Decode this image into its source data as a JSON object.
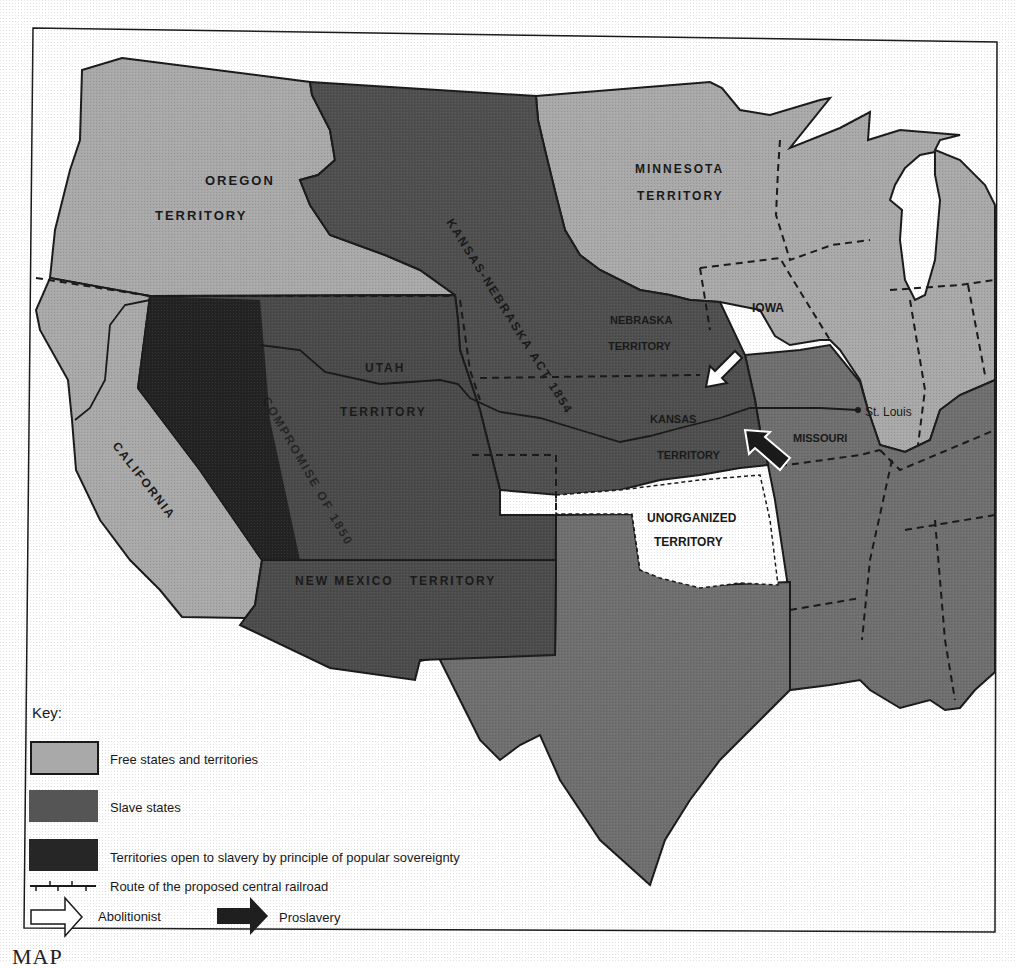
{
  "map": {
    "colors": {
      "free": "#a9a9a9",
      "slave": "#6f6f6f",
      "popular_sovereignty": "#4a4a4a",
      "popular_sovereignty_dark": "#1f1f1f",
      "unorganized": "#ffffff",
      "background": "#ffffff",
      "border": "#1a1a1a"
    },
    "regions": {
      "oregon": {
        "line1": "OREGON",
        "line2": "TERRITORY"
      },
      "minnesota": {
        "line1": "MINNESOTA",
        "line2": "TERRITORY"
      },
      "iowa": {
        "label": "IOWA"
      },
      "nebraska": {
        "line1": "NEBRASKA",
        "line2": "TERRITORY"
      },
      "utah": {
        "line1": "UTAH",
        "line2": "TERRITORY"
      },
      "kansas": {
        "line1": "KANSAS",
        "line2": "TERRITORY"
      },
      "missouri": {
        "label": "MISSOURI"
      },
      "california": {
        "label": "CALIFORNIA"
      },
      "new_mexico": {
        "label": "NEW MEXICO   TERRITORY"
      },
      "unorganized": {
        "line1": "UNORGANIZED",
        "line2": "TERRITORY"
      }
    },
    "annotations": {
      "kansas_nebraska_act": "KANSAS-NEBRASKA ACT 1854",
      "compromise_1850": "COMPROMISE OF 1850",
      "st_louis": "St. Louis"
    }
  },
  "key": {
    "title": "Key:",
    "items": [
      {
        "symbol": "free-swatch",
        "label": "Free states and territories"
      },
      {
        "symbol": "slave-swatch",
        "label": "Slave states"
      },
      {
        "symbol": "popular-sovereignty-swatch",
        "label": "Territories open to slavery by principle of popular sovereignty"
      },
      {
        "symbol": "railroad-line",
        "label": "Route of the proposed central railroad"
      }
    ],
    "arrows": [
      {
        "symbol": "white-arrow",
        "label": "Abolitionist"
      },
      {
        "symbol": "black-arrow",
        "label": "Proslavery"
      }
    ]
  },
  "caption": {
    "text": "MAP"
  }
}
